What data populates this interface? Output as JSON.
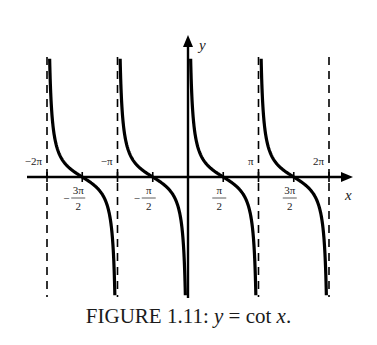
{
  "figure": {
    "caption_prefix": "FIGURE 1.11: ",
    "caption_y": "y",
    "caption_eq": " = ",
    "caption_cot": "cot",
    "caption_x": "x",
    "caption_end": "."
  },
  "chart_data": {
    "type": "line",
    "title": "FIGURE 1.11: y = cot x.",
    "function": "cot(x)",
    "xlabel": "x",
    "ylabel": "y",
    "x_range": [
      -6.5,
      7.0
    ],
    "y_clip": [
      -8.6,
      8.6
    ],
    "grid": false,
    "legend": null,
    "x_ticks_above": [
      {
        "value": -6.2832,
        "label": "−2π"
      },
      {
        "value": -3.1416,
        "label": "−π"
      },
      {
        "value": 3.1416,
        "label": "π"
      },
      {
        "value": 6.2832,
        "label": "2π"
      }
    ],
    "x_ticks_below": [
      {
        "value": -4.7124,
        "sign": "−",
        "num": "3π",
        "den": "2"
      },
      {
        "value": -1.5708,
        "sign": "−",
        "num": "π",
        "den": "2"
      },
      {
        "value": 1.5708,
        "sign": "",
        "num": "π",
        "den": "2"
      },
      {
        "value": 4.7124,
        "sign": "",
        "num": "3π",
        "den": "2"
      }
    ],
    "asymptotes": [
      -6.2832,
      -3.1416,
      0,
      3.1416,
      6.2832
    ],
    "branches": [
      {
        "from": -6.2832,
        "to": -3.1416,
        "zero": -4.7124
      },
      {
        "from": -3.1416,
        "to": 0,
        "zero": -1.5708
      },
      {
        "from": 0,
        "to": 3.1416,
        "zero": 1.5708
      },
      {
        "from": 3.1416,
        "to": 6.2832,
        "zero": 4.7124
      }
    ],
    "sample_points": [
      {
        "x": 0.3,
        "y": 3.23
      },
      {
        "x": 0.6,
        "y": 1.46
      },
      {
        "x": 1.0,
        "y": 0.64
      },
      {
        "x": 1.5708,
        "y": 0
      },
      {
        "x": 2.1,
        "y": -0.58
      },
      {
        "x": 2.6,
        "y": -1.66
      },
      {
        "x": 2.9,
        "y": -4.13
      }
    ],
    "colors": {
      "curve": "#000000",
      "asymptote": "#000000",
      "axis": "#000000"
    }
  }
}
